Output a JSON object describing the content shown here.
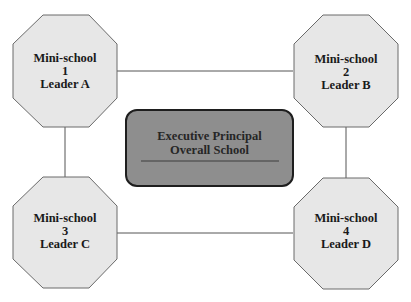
{
  "colors": {
    "octagon_fill": "#e7e7e7",
    "octagon_stroke": "#6a6a6a",
    "center_fill": "#8e8e8e",
    "center_stroke": "#1e1e1e",
    "connector": "#555555"
  },
  "center": {
    "line1": "Executive Principal",
    "line2": "Overall School"
  },
  "nodes": [
    {
      "title": "Mini-school",
      "number": "1",
      "leader": "Leader A"
    },
    {
      "title": "Mini-school",
      "number": "2",
      "leader": "Leader B"
    },
    {
      "title": "Mini-school",
      "number": "3",
      "leader": "Leader C"
    },
    {
      "title": "Mini-school",
      "number": "4",
      "leader": "Leader D"
    }
  ]
}
